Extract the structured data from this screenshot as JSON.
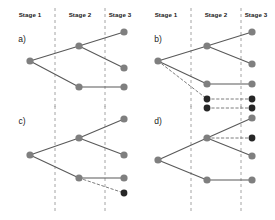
{
  "figure": {
    "width": 275,
    "height": 220,
    "background": "#ffffff",
    "colors": {
      "node_gray": "#7f7f7f",
      "node_dark": "#262626",
      "edge_solid": "#595959",
      "edge_dashed": "#6e6e6e",
      "divider": "#9a9a9a",
      "text": "#1a1a1a"
    }
  },
  "stage_headers": {
    "stage1": "Stage 1",
    "stage2": "Stage 2",
    "stage3": "Stage 3"
  },
  "panels": [
    {
      "id": "a",
      "label": "a)",
      "label_x": 22,
      "label_y": 42,
      "header_y": 17,
      "headers": [
        {
          "text": "Stage 1",
          "x": 30
        },
        {
          "text": "Stage 2",
          "x": 80
        },
        {
          "text": "Stage 3",
          "x": 120
        }
      ],
      "dividers": [
        {
          "x": 55,
          "y1": 8,
          "y2": 108
        },
        {
          "x": 105,
          "y1": 8,
          "y2": 108
        }
      ],
      "nodes": [
        {
          "name": "root",
          "x": 30,
          "y": 61,
          "r": 3.6,
          "tone": "gray"
        },
        {
          "name": "stage2-upper",
          "x": 79,
          "y": 46,
          "r": 3.6,
          "tone": "gray"
        },
        {
          "name": "stage2-lower",
          "x": 79,
          "y": 87,
          "r": 3.6,
          "tone": "gray"
        },
        {
          "name": "stage3-top",
          "x": 124,
          "y": 32,
          "r": 3.6,
          "tone": "gray"
        },
        {
          "name": "stage3-mid",
          "x": 124,
          "y": 68,
          "r": 3.6,
          "tone": "gray"
        },
        {
          "name": "stage3-bottom",
          "x": 124,
          "y": 87,
          "r": 3.6,
          "tone": "gray"
        }
      ],
      "edges": [
        {
          "name": "root-to-stage2-upper",
          "x1": 30,
          "y1": 61,
          "x2": 79,
          "y2": 46,
          "style": "solid",
          "tone": "gray"
        },
        {
          "name": "root-to-stage2-lower",
          "x1": 30,
          "y1": 61,
          "x2": 79,
          "y2": 87,
          "style": "solid",
          "tone": "gray"
        },
        {
          "name": "stage2-upper-to-top",
          "x1": 79,
          "y1": 46,
          "x2": 124,
          "y2": 32,
          "style": "solid",
          "tone": "gray"
        },
        {
          "name": "stage2-upper-to-mid",
          "x1": 79,
          "y1": 46,
          "x2": 124,
          "y2": 68,
          "style": "solid",
          "tone": "gray"
        },
        {
          "name": "stage2-lower-to-bottom",
          "x1": 79,
          "y1": 87,
          "x2": 124,
          "y2": 87,
          "style": "solid",
          "tone": "gray"
        }
      ]
    },
    {
      "id": "b",
      "label": "b)",
      "label_x": 158,
      "label_y": 42,
      "header_y": 17,
      "headers": [
        {
          "text": "Stage 1",
          "x": 166
        },
        {
          "text": "Stage 2",
          "x": 216
        },
        {
          "text": "Stage 3",
          "x": 256
        }
      ],
      "dividers": [
        {
          "x": 191,
          "y1": 8,
          "y2": 108
        },
        {
          "x": 241,
          "y1": 8,
          "y2": 108
        }
      ],
      "nodes": [
        {
          "name": "root",
          "x": 158,
          "y": 61,
          "r": 3.6,
          "tone": "gray"
        },
        {
          "name": "stage2-upper",
          "x": 207,
          "y": 46,
          "r": 3.6,
          "tone": "gray"
        },
        {
          "name": "stage2-lower",
          "x": 207,
          "y": 84,
          "r": 3.6,
          "tone": "gray"
        },
        {
          "name": "stage2-new",
          "x": 207,
          "y": 99,
          "r": 3.4,
          "tone": "dark"
        },
        {
          "name": "stage3-top",
          "x": 252,
          "y": 32,
          "r": 3.6,
          "tone": "gray"
        },
        {
          "name": "stage3-mid",
          "x": 252,
          "y": 64,
          "r": 3.6,
          "tone": "gray"
        },
        {
          "name": "stage3-lower",
          "x": 252,
          "y": 84,
          "r": 3.6,
          "tone": "gray"
        },
        {
          "name": "stage3-new",
          "x": 252,
          "y": 99,
          "r": 3.4,
          "tone": "dark"
        }
      ],
      "edges": [
        {
          "name": "root-to-stage2-upper",
          "x1": 158,
          "y1": 61,
          "x2": 207,
          "y2": 46,
          "style": "solid",
          "tone": "gray"
        },
        {
          "name": "root-to-stage2-lower",
          "x1": 158,
          "y1": 61,
          "x2": 207,
          "y2": 84,
          "style": "solid",
          "tone": "gray"
        },
        {
          "name": "root-to-stage2-new",
          "x1": 158,
          "y1": 61,
          "x2": 207,
          "y2": 99,
          "style": "dashed",
          "tone": "gray"
        },
        {
          "name": "stage2-upper-to-top",
          "x1": 207,
          "y1": 46,
          "x2": 252,
          "y2": 32,
          "style": "solid",
          "tone": "gray"
        },
        {
          "name": "stage2-upper-to-mid",
          "x1": 207,
          "y1": 46,
          "x2": 252,
          "y2": 64,
          "style": "solid",
          "tone": "gray"
        },
        {
          "name": "stage2-lower-to-lower",
          "x1": 207,
          "y1": 84,
          "x2": 252,
          "y2": 84,
          "style": "solid",
          "tone": "gray"
        },
        {
          "name": "stage2-new-to-new",
          "x1": 207,
          "y1": 99,
          "x2": 252,
          "y2": 99,
          "style": "dashed",
          "tone": "gray"
        }
      ]
    },
    {
      "id": "c",
      "label": "c)",
      "label_x": 22,
      "label_y": 124,
      "header_y": 0,
      "headers": [],
      "dividers": [
        {
          "x": 55,
          "y1": 106,
          "y2": 212
        },
        {
          "x": 105,
          "y1": 106,
          "y2": 212
        }
      ],
      "nodes": [
        {
          "name": "root",
          "x": 30,
          "y": 155,
          "r": 3.6,
          "tone": "gray"
        },
        {
          "name": "stage2-upper",
          "x": 79,
          "y": 138,
          "r": 3.6,
          "tone": "gray"
        },
        {
          "name": "stage2-lower",
          "x": 79,
          "y": 178,
          "r": 3.6,
          "tone": "gray"
        },
        {
          "name": "stage3-top",
          "x": 124,
          "y": 119,
          "r": 3.6,
          "tone": "gray"
        },
        {
          "name": "stage3-mid",
          "x": 124,
          "y": 155,
          "r": 3.6,
          "tone": "gray"
        },
        {
          "name": "stage3-lower",
          "x": 124,
          "y": 178,
          "r": 3.6,
          "tone": "gray"
        },
        {
          "name": "stage3-new",
          "x": 124,
          "y": 193,
          "r": 3.4,
          "tone": "dark"
        }
      ],
      "edges": [
        {
          "name": "root-to-stage2-upper",
          "x1": 30,
          "y1": 155,
          "x2": 79,
          "y2": 138,
          "style": "solid",
          "tone": "gray"
        },
        {
          "name": "root-to-stage2-lower",
          "x1": 30,
          "y1": 155,
          "x2": 79,
          "y2": 178,
          "style": "solid",
          "tone": "gray"
        },
        {
          "name": "stage2-upper-to-top",
          "x1": 79,
          "y1": 138,
          "x2": 124,
          "y2": 119,
          "style": "solid",
          "tone": "gray"
        },
        {
          "name": "stage2-upper-to-mid",
          "x1": 79,
          "y1": 138,
          "x2": 124,
          "y2": 155,
          "style": "solid",
          "tone": "gray"
        },
        {
          "name": "stage2-lower-to-lower",
          "x1": 79,
          "y1": 178,
          "x2": 124,
          "y2": 178,
          "style": "solid",
          "tone": "gray"
        },
        {
          "name": "stage2-lower-to-new",
          "x1": 79,
          "y1": 178,
          "x2": 124,
          "y2": 193,
          "style": "dashed",
          "tone": "gray"
        }
      ]
    },
    {
      "id": "d",
      "label": "d)",
      "label_x": 158,
      "label_y": 124,
      "header_y": 0,
      "headers": [],
      "dividers": [
        {
          "x": 191,
          "y1": 106,
          "y2": 212
        },
        {
          "x": 241,
          "y1": 106,
          "y2": 212
        }
      ],
      "nodes": [
        {
          "name": "root",
          "x": 158,
          "y": 160,
          "r": 3.6,
          "tone": "gray"
        },
        {
          "name": "stage2-upper",
          "x": 207,
          "y": 138,
          "r": 3.6,
          "tone": "gray"
        },
        {
          "name": "stage2-lower",
          "x": 207,
          "y": 180,
          "r": 3.6,
          "tone": "gray"
        },
        {
          "name": "stage2-new",
          "x": 207,
          "y": 108,
          "r": 3.4,
          "tone": "dark"
        },
        {
          "name": "stage3-top",
          "x": 252,
          "y": 118,
          "r": 3.6,
          "tone": "gray"
        },
        {
          "name": "stage3-new-upper",
          "x": 252,
          "y": 138,
          "r": 3.4,
          "tone": "dark"
        },
        {
          "name": "stage3-mid",
          "x": 252,
          "y": 156,
          "r": 3.6,
          "tone": "gray"
        },
        {
          "name": "stage3-lower",
          "x": 252,
          "y": 180,
          "r": 3.6,
          "tone": "gray"
        },
        {
          "name": "stage3-new-top",
          "x": 252,
          "y": 108,
          "r": 3.4,
          "tone": "dark"
        }
      ],
      "edges": [
        {
          "name": "root-to-stage2-upper",
          "x1": 158,
          "y1": 160,
          "x2": 207,
          "y2": 138,
          "style": "solid",
          "tone": "gray"
        },
        {
          "name": "root-to-stage2-lower",
          "x1": 158,
          "y1": 160,
          "x2": 207,
          "y2": 180,
          "style": "solid",
          "tone": "gray"
        },
        {
          "name": "stage2-upper-to-top",
          "x1": 207,
          "y1": 138,
          "x2": 252,
          "y2": 118,
          "style": "solid",
          "tone": "gray"
        },
        {
          "name": "stage2-upper-to-new",
          "x1": 207,
          "y1": 138,
          "x2": 252,
          "y2": 138,
          "style": "dashed",
          "tone": "gray"
        },
        {
          "name": "stage2-upper-to-mid",
          "x1": 207,
          "y1": 138,
          "x2": 252,
          "y2": 156,
          "style": "solid",
          "tone": "gray"
        },
        {
          "name": "stage2-lower-to-lower",
          "x1": 207,
          "y1": 180,
          "x2": 252,
          "y2": 180,
          "style": "solid",
          "tone": "gray"
        },
        {
          "name": "stage2-new-to-new-top",
          "x1": 207,
          "y1": 108,
          "x2": 252,
          "y2": 108,
          "style": "dashed",
          "tone": "gray"
        }
      ]
    }
  ]
}
